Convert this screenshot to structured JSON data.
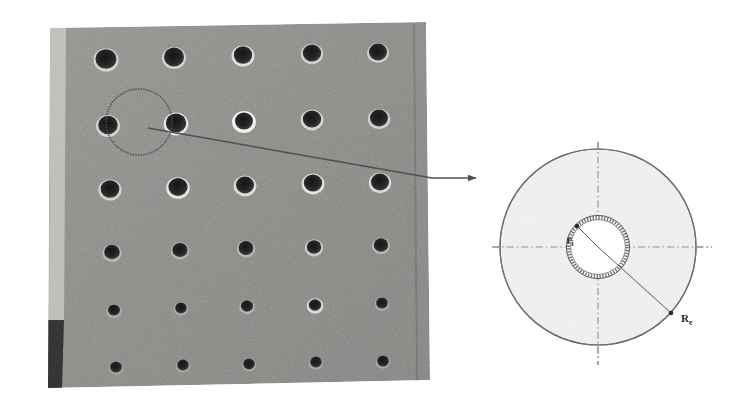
{
  "figure": {
    "domain_type": "technical-figure",
    "background_color": "#ffffff"
  },
  "photo": {
    "name": "perforated-plate-photograph",
    "description": "Grayscale photograph of a perforated concrete/metal plate viewed in perspective",
    "plate_color": "#8c8c8c",
    "hole_color": "#2e2e2e",
    "hole_highlight_color": "#d8d8d8",
    "edge_shadow_color": "#3a3a3a",
    "rows": 6,
    "columns": 6,
    "annotation_circle": {
      "name": "highlighted-hole-circle",
      "center_x": 140,
      "center_y": 122,
      "radius": 33,
      "stroke_color": "#4a4a4a"
    }
  },
  "leader": {
    "name": "callout-leader-line",
    "stroke_color": "#4f4f4f",
    "start_x": 148,
    "start_y": 128,
    "bend_x": 432,
    "bend_y": 178,
    "arrow_end_x": 476,
    "arrow_end_y": 178
  },
  "diagram": {
    "name": "hole-cross-section-schematic",
    "outer_circle": {
      "label": "Re",
      "label_main": "R",
      "label_sub": "e",
      "radius_px": 98,
      "fill_color": "#f2f2f2",
      "stroke_color": "#6e6e6e"
    },
    "inner_circle": {
      "label": "ri",
      "label_main": "r",
      "label_sub": "i",
      "radius_px": 31,
      "fill_color": "#ffffff",
      "stroke_color": "#5a5a5a",
      "ring_style": "hatched"
    },
    "axes": {
      "name": "center-lines",
      "style": "dash-dot",
      "stroke_color": "#8a8a8a",
      "horizontal_label": "",
      "vertical_label": ""
    },
    "radius_lines": [
      {
        "name": "inner-radius-arrow",
        "label": "ri",
        "angle_deg": 135
      },
      {
        "name": "outer-radius-arrow",
        "label": "Re",
        "angle_deg": -42
      }
    ]
  }
}
